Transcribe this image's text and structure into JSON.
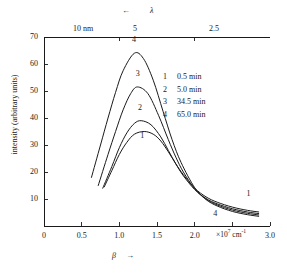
{
  "figure": {
    "background": "#ffffff",
    "ink": "#1a1a1a"
  },
  "top_axis": {
    "symbol": "λ",
    "arrow": "←",
    "ticks": [
      {
        "label": "10 nm",
        "x_value": 1.0
      },
      {
        "label": "5",
        "x_value": 2.0
      },
      {
        "label": "2.5",
        "x_value": 4.0
      }
    ]
  },
  "y_axis": {
    "title": "intensity (arbitrary units)",
    "ticks": [
      0,
      10,
      20,
      30,
      40,
      50,
      60,
      70
    ],
    "tick_labels": [
      "",
      "10",
      "20",
      "30",
      "40",
      "50",
      "60",
      "70"
    ],
    "range": [
      0,
      70
    ]
  },
  "x_axis": {
    "symbol": "β",
    "arrow": "→",
    "unit_mantissa": "×10",
    "unit_exponent": "7",
    "unit_tail": " cm",
    "unit_tail_exponent": "-1",
    "ticks": [
      0,
      0.5,
      1.0,
      1.5,
      2.0,
      2.5,
      3.0
    ],
    "tick_labels": [
      "0",
      "0.5",
      "1.0",
      "1.5",
      "2.0",
      "2.5",
      "3.0"
    ],
    "range": [
      0,
      3.0
    ]
  },
  "legend": {
    "entries": [
      {
        "key": "1",
        "value": "0.5 min"
      },
      {
        "key": "2",
        "value": "5.0 min"
      },
      {
        "key": "3",
        "value": "34.5 min"
      },
      {
        "key": "4",
        "value": "65.0 min"
      }
    ]
  },
  "curve_labels": [
    {
      "key": "4",
      "x": 1.2,
      "y": 68.5
    },
    {
      "key": "3",
      "x": 1.25,
      "y": 56.0
    },
    {
      "key": "2",
      "x": 1.28,
      "y": 43.5
    },
    {
      "key": "1",
      "x": 1.31,
      "y": 33.0
    },
    {
      "key": "1",
      "x": 2.72,
      "y": 11.5
    },
    {
      "key": "4",
      "x": 2.28,
      "y": 4.0
    }
  ],
  "chart_data": {
    "type": "line",
    "title": "",
    "xlabel": "β  (×10⁷ cm⁻¹)",
    "ylabel": "intensity (arbitrary units)",
    "xlim": [
      0,
      3.0
    ],
    "ylim": [
      0,
      70
    ],
    "grid": false,
    "legend_position": "inside-upper-right",
    "secondary_x_axis": {
      "label": "λ",
      "unit": "nm",
      "tick_labels": [
        "10 nm",
        "5",
        "2.5"
      ],
      "tick_positions_in_beta": [
        1.0,
        2.0,
        4.0
      ]
    },
    "series": [
      {
        "name": "1",
        "legend": "0.5 min",
        "peak_x": 1.33,
        "peak_y": 35.0,
        "x": [
          0.8,
          0.9,
          1.0,
          1.1,
          1.2,
          1.33,
          1.45,
          1.55,
          1.65,
          1.75,
          1.85,
          2.0,
          2.15,
          2.3,
          2.5,
          2.7,
          2.85
        ],
        "y": [
          14.5,
          20.5,
          26.5,
          31.0,
          34.0,
          35.0,
          34.0,
          31.5,
          27.5,
          23.0,
          19.0,
          14.0,
          10.8,
          8.8,
          7.0,
          5.8,
          5.2
        ]
      },
      {
        "name": "2",
        "legend": "5.0 min",
        "peak_x": 1.29,
        "peak_y": 39.0,
        "x": [
          0.78,
          0.9,
          1.0,
          1.1,
          1.2,
          1.29,
          1.42,
          1.55,
          1.65,
          1.75,
          1.85,
          2.0,
          2.15,
          2.3,
          2.5,
          2.7,
          2.85
        ],
        "y": [
          14.0,
          22.0,
          29.0,
          34.5,
          38.0,
          39.0,
          37.5,
          33.0,
          28.0,
          23.0,
          18.6,
          13.5,
          10.2,
          8.2,
          6.4,
          5.2,
          4.6
        ]
      },
      {
        "name": "3",
        "legend": "34.5 min",
        "peak_x": 1.24,
        "peak_y": 51.5,
        "x": [
          0.72,
          0.85,
          0.95,
          1.05,
          1.15,
          1.24,
          1.38,
          1.52,
          1.65,
          1.75,
          1.85,
          2.0,
          2.15,
          2.3,
          2.5,
          2.7,
          2.85
        ],
        "y": [
          15.0,
          26.5,
          35.0,
          43.0,
          49.0,
          51.5,
          49.0,
          41.0,
          32.0,
          25.5,
          20.0,
          13.8,
          10.0,
          7.8,
          5.9,
          4.7,
          4.1
        ]
      },
      {
        "name": "4",
        "legend": "65.0 min",
        "peak_x": 1.2,
        "peak_y": 64.0,
        "x": [
          0.63,
          0.75,
          0.85,
          0.95,
          1.05,
          1.2,
          1.32,
          1.45,
          1.58,
          1.7,
          1.82,
          2.0,
          2.15,
          2.3,
          2.5,
          2.7,
          2.85
        ],
        "y": [
          18.0,
          30.0,
          40.0,
          49.5,
          57.5,
          64.0,
          62.0,
          54.0,
          42.5,
          32.0,
          23.5,
          14.2,
          9.8,
          7.4,
          5.4,
          4.2,
          3.6
        ]
      }
    ]
  }
}
